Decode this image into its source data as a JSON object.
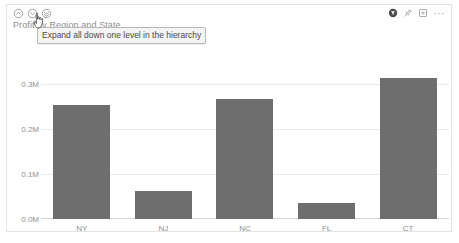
{
  "visual": {
    "title": "Profit by Region and State"
  },
  "drill_controls": [
    {
      "name": "drill-up-icon",
      "label": "Drill up"
    },
    {
      "name": "drill-down-icon",
      "label": "Drill down"
    },
    {
      "name": "expand-all-icon",
      "label": "Expand all down one level in the hierarchy"
    }
  ],
  "header_actions": [
    {
      "name": "filter-icon",
      "label": "Filters"
    },
    {
      "name": "pin-icon",
      "label": "Pin visual"
    },
    {
      "name": "focus-mode-icon",
      "label": "Focus mode"
    },
    {
      "name": "more-options-icon",
      "label": "···"
    }
  ],
  "tooltip": {
    "text": "Expand all down one level in the hierarchy"
  },
  "colors": {
    "bar": "#6e6e6e",
    "gridline": "#eaeaea",
    "axis_text": "#909090",
    "title_text": "#8d8d8d",
    "card_border": "#e3e3e3",
    "tooltip_bg": "#f4f4f4",
    "tooltip_border": "#b8b8b8"
  },
  "chart_data": {
    "type": "bar",
    "title": "Profit by Region and State",
    "xlabel": "",
    "ylabel": "",
    "categories": [
      "NY",
      "NJ",
      "NC",
      "FL",
      "CT"
    ],
    "values": [
      0.252,
      0.062,
      0.265,
      0.035,
      0.312
    ],
    "value_unit": "M",
    "ylim": [
      0,
      0.35
    ],
    "ytick_values": [
      0.0,
      0.1,
      0.2,
      0.3
    ],
    "ytick_labels": [
      "0.0M",
      "0.1M",
      "0.2M",
      "0.3M"
    ],
    "grid": true,
    "legend": false,
    "series": [
      {
        "name": "Profit",
        "values": [
          0.252,
          0.062,
          0.265,
          0.035,
          0.312
        ]
      }
    ]
  }
}
